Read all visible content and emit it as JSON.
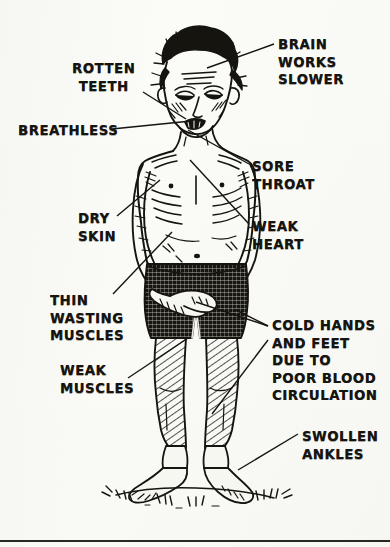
{
  "figure": {
    "title_alt": "Emaciated standing figure with callout labels",
    "ink_color": "#16140f",
    "paper_color": "#fbfbf8"
  },
  "labels": [
    {
      "id": "brain-works-slower",
      "text": "BRAIN\nWORKS\nSLOWER",
      "x": 278,
      "y": 36,
      "align": "left"
    },
    {
      "id": "rotten-teeth",
      "text": "ROTTEN\nTEETH",
      "x": 72,
      "y": 60,
      "align": "center"
    },
    {
      "id": "breathless",
      "text": "BREATHLESS",
      "x": 18,
      "y": 122,
      "align": "left"
    },
    {
      "id": "sore-throat",
      "text": "SORE\nTHROAT",
      "x": 252,
      "y": 158,
      "align": "left"
    },
    {
      "id": "dry-skin",
      "text": "DRY\nSKIN",
      "x": 78,
      "y": 210,
      "align": "left"
    },
    {
      "id": "weak-heart",
      "text": "WEAK\nHEART",
      "x": 252,
      "y": 218,
      "align": "left"
    },
    {
      "id": "thin-wasting-muscles",
      "text": "THIN\nWASTING\nMUSCLES",
      "x": 50,
      "y": 292,
      "align": "left"
    },
    {
      "id": "cold-hands-and-feet",
      "text": "COLD HANDS\nAND FEET\nDUE TO\nPOOR BLOOD\nCIRCULATION",
      "x": 272,
      "y": 317,
      "align": "left"
    },
    {
      "id": "weak-muscles",
      "text": "WEAK\nMUSCLES",
      "x": 60,
      "y": 362,
      "align": "left"
    },
    {
      "id": "swollen-ankles",
      "text": "SWOLLEN\nANKLES",
      "x": 302,
      "y": 428,
      "align": "left"
    }
  ],
  "leader_lines": [
    {
      "id": "leader-brain",
      "from": [
        274,
        44
      ],
      "to": [
        207,
        68
      ]
    },
    {
      "id": "leader-teeth",
      "from": [
        143,
        92
      ],
      "to": [
        186,
        119
      ]
    },
    {
      "id": "leader-breathless",
      "from": [
        112,
        129
      ],
      "to": [
        191,
        121
      ]
    },
    {
      "id": "leader-sore-throat",
      "from": [
        249,
        164
      ],
      "to": [
        188,
        130
      ]
    },
    {
      "id": "leader-dry-skin",
      "from": [
        117,
        216
      ],
      "to": [
        160,
        180
      ]
    },
    {
      "id": "leader-weak-heart",
      "from": [
        249,
        224
      ],
      "to": [
        190,
        160
      ]
    },
    {
      "id": "leader-thin-wasting",
      "from": [
        113,
        294
      ],
      "to": [
        172,
        232
      ]
    },
    {
      "id": "leader-cold-hands-1",
      "from": [
        268,
        326
      ],
      "to": [
        236,
        310
      ]
    },
    {
      "id": "leader-cold-hands-2",
      "from": [
        268,
        326
      ],
      "to": [
        196,
        302
      ]
    },
    {
      "id": "leader-cold-hands-3",
      "from": [
        268,
        340
      ],
      "to": [
        212,
        414
      ]
    },
    {
      "id": "leader-weak-muscles",
      "from": [
        128,
        378
      ],
      "to": [
        188,
        338
      ]
    },
    {
      "id": "leader-swollen",
      "from": [
        298,
        434
      ],
      "to": [
        238,
        470
      ]
    }
  ],
  "divider": {
    "id": "bottom-rule",
    "y": 540
  }
}
